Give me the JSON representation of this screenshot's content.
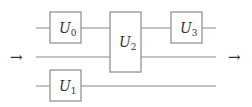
{
  "diagram": {
    "type": "quantum-circuit",
    "wires": [
      {
        "id": "top",
        "y": 28
      },
      {
        "id": "middle",
        "y": 57
      },
      {
        "id": "bottom",
        "y": 86
      }
    ],
    "gates": [
      {
        "id": "U0",
        "letter": "U",
        "subscript": "0",
        "wires": [
          "top"
        ]
      },
      {
        "id": "U1",
        "letter": "U",
        "subscript": "1",
        "wires": [
          "bottom"
        ]
      },
      {
        "id": "U2",
        "letter": "U",
        "subscript": "2",
        "wires": [
          "top",
          "middle"
        ]
      },
      {
        "id": "U3",
        "letter": "U",
        "subscript": "3",
        "wires": [
          "top"
        ]
      }
    ],
    "input_arrow": "→",
    "output_arrow": "→"
  }
}
